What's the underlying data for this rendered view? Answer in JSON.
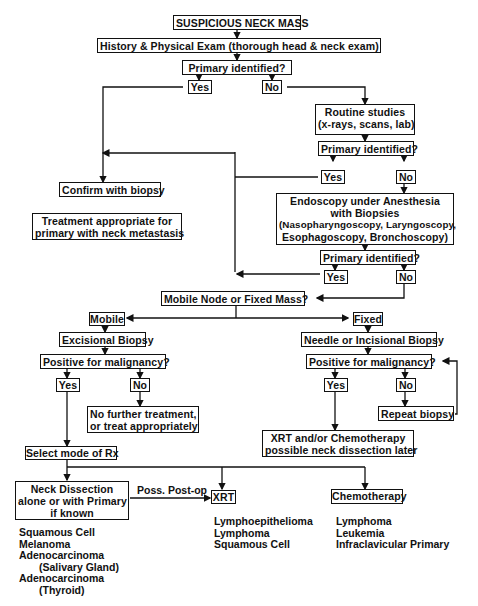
{
  "title": "SUSPICIOUS NECK MASS",
  "nodes": {
    "start": "SUSPICIOUS NECK MASS",
    "history": "History & Physical Exam (thorough head & neck exam)",
    "primary_q1": "Primary identified?",
    "yes1": "Yes",
    "no1": "No",
    "routine": [
      "Routine studies",
      "(x-rays, scans, lab)"
    ],
    "primary_q2": "Primary identified?",
    "yes2": "Yes",
    "no2": "No",
    "confirm": "Confirm with biopsy",
    "treatment": [
      "Treatment appropriate for",
      "primary with neck metastasis"
    ],
    "endoscopy": [
      "Endoscopy under Anesthesia",
      "with Biopsies",
      "(Nasopharyngoscopy, Laryngoscopy,",
      "Esophagoscopy, Bronchoscopy)"
    ],
    "primary_q3": "Primary identified?",
    "yes3": "Yes",
    "no3": "No",
    "mobile_fixed_q": "Mobile Node or Fixed Mass?",
    "mobile": "Mobile",
    "fixed": "Fixed",
    "excisional": "Excisional Biopsy",
    "positive_q_left": "Positive for malignancy?",
    "yes_left": "Yes",
    "no_left": "No",
    "no_further": [
      "No further treatment,",
      "or treat appropriately"
    ],
    "needle": "Needle or Incisional Biopsy",
    "positive_q_right": "Positive for malignancy?",
    "yes_right": "Yes",
    "no_right": "No",
    "repeat": "Repeat biopsy",
    "xrt_chemo": [
      "XRT and/or Chemotherapy",
      "possible neck dissection later"
    ],
    "select_rx": "Select mode of Rx",
    "neck_dissection": [
      "Neck Dissection",
      "alone or with Primary",
      "if known"
    ],
    "poss_postop": "Poss. Post-op",
    "xrt": "XRT",
    "chemotherapy": "Chemotherapy"
  },
  "lists": {
    "neck_dissection": [
      "Squamous Cell",
      "Melanoma",
      "Adenocarcinoma",
      "    (Salivary Gland)",
      "Adenocarcinoma",
      "    (Thyroid)"
    ],
    "xrt": [
      "Lymphoepithelioma",
      "Lymphoma",
      "Squamous Cell"
    ],
    "chemotherapy": [
      "Lymphoma",
      "Leukemia",
      "Infraclavicular Primary"
    ]
  }
}
